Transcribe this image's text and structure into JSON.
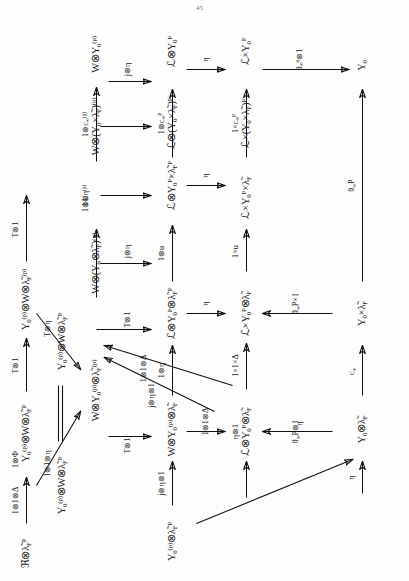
{
  "document": {
    "type": "scanned-commutative-diagram",
    "orientation": "rotated-90-ccw",
    "page_number": "45"
  },
  "diagram": {
    "nodes": [
      {
        "id": "n_r1c1",
        "text": "&#8476;&#8855;&#955;&#771;<sub>F</sub><sup>P</sup>"
      },
      {
        "id": "n_r1c2",
        "text": "Y<sub>0</sub><sup>(p)</sup>&#8855;W&#8855;&#955;&#771;<sub>F</sub><sup>P</sup>"
      },
      {
        "id": "n_r1c3",
        "text": "Y<sub>0</sub><sup>(p)</sup>&#8855;W&#8855;&#955;&#771;<sub>F</sub><sup>(p)</sup>"
      },
      {
        "id": "n_r2c1",
        "text": "Y<sub>0</sub><sup>(p)</sup>&#8855;W&#8855;&#955;&#771;<sub>F</sub><sup>P</sup>"
      },
      {
        "id": "n_r2c2",
        "text": "Y<sub>0</sub><sup>(p)</sup>&#8855;W&#8855;&#955;&#771;<sub>F</sub><sup>P</sup>"
      },
      {
        "id": "n_r2c3",
        "text": "W&#8855;Y<sub>0</sub><sup>(p)</sup>&#8855;&#955;&#771;<sub>F</sub><sup>(p)</sup>"
      },
      {
        "id": "n_r2c4",
        "text": "W&#8855;(Y<sub>0</sub>&#8855;&#955;&#771;<sub>F</sub>)<sup>(p)</sup>"
      },
      {
        "id": "n_r2c5",
        "text": "W&#8855;(Y<sub>0</sub>&#215;&#955;&#771;<sub>F</sub>)<sup>(p)</sup>"
      },
      {
        "id": "n_r2c6",
        "text": "W&#8855;Y<sub>0</sub><sup>(p)</sup>"
      },
      {
        "id": "n_r3c1",
        "text": "Y<sub>0</sub><sup>(p)</sup>&#8855;&#955;&#771;<sub>F</sub><sup>P</sup>"
      },
      {
        "id": "n_r3c2",
        "text": "W&#8855;Y<sub>0</sub><sup>(p)</sup>&#8855;&#955;&#771;<sub>F</sub>"
      },
      {
        "id": "n_r3c3",
        "text": "&#8466;&#8855;Y<sub>0</sub><sup>P</sup>&#8855;&#955;&#771;<sub>F</sub><sup>P</sup>"
      },
      {
        "id": "n_r3c4",
        "text": "&#8466;&#8855;Y<sub>0</sub><sup>P</sup>&#215;&#955;&#771;<sub>F</sub><sup>P</sup>"
      },
      {
        "id": "n_r3c5",
        "text": "&#8466;&#8855;(Y<sub>0</sub>&#215;&#955;&#771;<sub>F</sub>)<sup>P</sup>"
      },
      {
        "id": "n_r3c6",
        "text": "&#8466;&#8855;Y<sub>0</sub><sup>P</sup>"
      },
      {
        "id": "n_r4c2",
        "text": "&#8466;&#8855;Y<sub>0</sub><sup>P</sup>&#8855;&#955;&#771;<sub>F</sub>"
      },
      {
        "id": "n_r4c3",
        "text": "&#8466;&#215;Y<sub>0</sub><sup>P</sup>&#8855;&#955;&#771;<sub>F</sub>"
      },
      {
        "id": "n_r4c4",
        "text": "&#8466;&#215;Y<sub>0</sub><sup>P</sup>&#215;&#955;&#771;<sub>F</sub>"
      },
      {
        "id": "n_r4c5",
        "text": "&#8466;&#215;(Y<sub>0</sub>&#215;&#955;&#771;<sub>F</sub>)<sup>P</sup>"
      },
      {
        "id": "n_r4c6",
        "text": "&#8466;&#215;Y<sub>0</sub><sup>P</sup>"
      },
      {
        "id": "n_r5c4",
        "text": "Y<sub>0</sub>&#8855;&#955;&#771;<sub>F</sub>"
      },
      {
        "id": "n_r5c5",
        "text": "Y<sub>0</sub>&#215;&#955;&#771;<sub>F</sub>"
      },
      {
        "id": "n_r5c6",
        "text": "Y<sub>0</sub>"
      }
    ],
    "arrow_labels": [
      {
        "id": "a1",
        "text": "1&#8855;1&#8855;&#916;"
      },
      {
        "id": "a2",
        "text": "1&#8855;&#934;"
      },
      {
        "id": "a3",
        "text": "T&#8855;1"
      },
      {
        "id": "a4",
        "text": "1&#8855;1&#8855;&#951;"
      },
      {
        "id": "a5",
        "text": "T&#8855;&#951;"
      },
      {
        "id": "a6",
        "text": "T&#8855;1"
      },
      {
        "id": "a7",
        "text": "1&#8855;U"
      },
      {
        "id": "a8",
        "text": "1&#8855;&#951;<sup>(p)</sup>"
      },
      {
        "id": "a9",
        "text": "1&#8855;c<sub>&#8734;</sub><sup>(p)</sup>"
      },
      {
        "id": "a10",
        "text": "T&#8855;1"
      },
      {
        "id": "a11",
        "text": "1&#8855;1&#8855;&#916;"
      },
      {
        "id": "a12",
        "text": "j&#8855;&#951;&#8855;1"
      },
      {
        "id": "a13",
        "text": "T&#8855;1"
      },
      {
        "id": "a14",
        "text": "j&#8855;&#951;&#8855;1"
      },
      {
        "id": "a15",
        "text": "j&#8855;&#951;"
      },
      {
        "id": "a16",
        "text": "1&#8855;&#951;"
      },
      {
        "id": "a17",
        "text": "1&#8855;u"
      },
      {
        "id": "a18",
        "text": "1&#8855;c<sub>&#8734;</sub><sup>P</sup>"
      },
      {
        "id": "a19",
        "text": "j&#8855;&#951;"
      },
      {
        "id": "a20",
        "text": "1&#8855;1&#8855;&#916;"
      },
      {
        "id": "a21",
        "text": "&#951;&#8855;1"
      },
      {
        "id": "a22",
        "text": "1&#215;1&#215;&#916;"
      },
      {
        "id": "a23",
        "text": "&#951;"
      },
      {
        "id": "a24",
        "text": "1&#215;u"
      },
      {
        "id": "a25",
        "text": "1&#215;c<sub>&#8734;</sub><sup>P</sup>"
      },
      {
        "id": "a26",
        "text": "&#951;"
      },
      {
        "id": "a27",
        "text": "&#951;"
      },
      {
        "id": "a28",
        "text": "&#951;"
      },
      {
        "id": "a29",
        "text": "&#952;<sub>&#8734;</sub>P&#8855;1"
      },
      {
        "id": "a30",
        "text": "&#952;<sub>&#8734;</sub>P&#215;1"
      },
      {
        "id": "a31",
        "text": "&#951;"
      },
      {
        "id": "a32",
        "text": "c<sub>&#8734;</sub>"
      },
      {
        "id": "a33",
        "text": "&#952;<sub>&#8734;</sub>P"
      },
      {
        "id": "a34",
        "text": "&#952;<sub>&#8734;</sub><sup>#</sup>&#8855;1"
      }
    ]
  }
}
